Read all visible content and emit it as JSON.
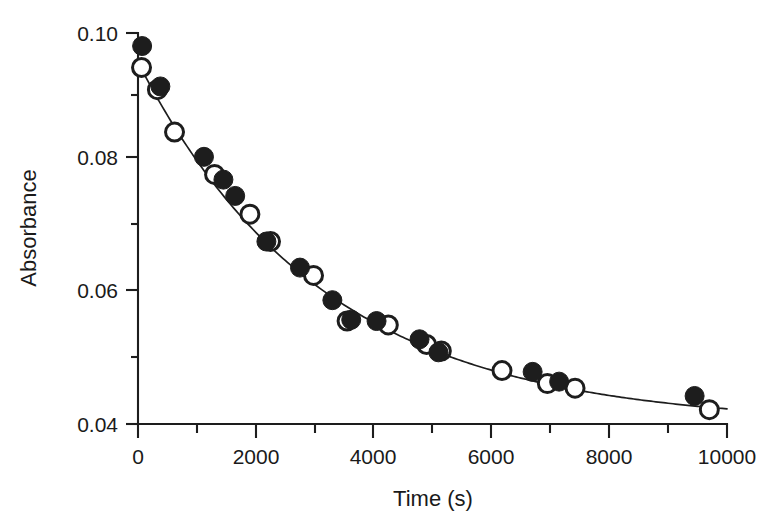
{
  "chart_data": {
    "type": "scatter",
    "title": "",
    "subtitle": "",
    "xlabel": "Time (s)",
    "ylabel": "Absorbance",
    "xlim": [
      0,
      10000
    ],
    "ylim": [
      0.04,
      0.1
    ],
    "xticks": [
      0,
      2000,
      4000,
      6000,
      8000,
      10000
    ],
    "xticklabels": [
      "0",
      "2000",
      "4000",
      "6000",
      "8000",
      "10000"
    ],
    "xminorticks": [
      1000,
      3000,
      5000,
      7000,
      9000
    ],
    "yticks": [
      0.04,
      0.06,
      0.08,
      0.1
    ],
    "yticklabels": [
      "0.04",
      "0.06",
      "0.08",
      "0.10"
    ],
    "yminorticks": [
      0.05,
      0.07,
      0.09
    ],
    "grid": false,
    "legend": null,
    "legend_position": "none",
    "annotations": [],
    "series": [
      {
        "name": "filled-circles",
        "marker": "filled-circle",
        "color": "#1d1d1d",
        "x": [
          70,
          380,
          1120,
          1450,
          1650,
          2180,
          2750,
          3300,
          3620,
          4050,
          4780,
          5100,
          6700,
          7150,
          9450
        ],
        "y": [
          0.098,
          0.0918,
          0.081,
          0.0775,
          0.075,
          0.068,
          0.064,
          0.059,
          0.056,
          0.0558,
          0.053,
          0.051,
          0.048,
          0.0465,
          0.0443
        ]
      },
      {
        "name": "open-circles",
        "marker": "open-circle",
        "color": "#1d1d1d",
        "x": [
          60,
          330,
          620,
          1300,
          1900,
          2250,
          2980,
          3550,
          4250,
          4900,
          5150,
          6180,
          6950,
          7420,
          9700
        ],
        "y": [
          0.0947,
          0.0913,
          0.0848,
          0.0783,
          0.0722,
          0.068,
          0.0628,
          0.0558,
          0.0552,
          0.0522,
          0.0512,
          0.0482,
          0.0462,
          0.0455,
          0.0422
        ]
      }
    ],
    "fit_curve": {
      "name": "exponential-fit",
      "model": "A(t) = A_inf + (A_0 - A_inf) * exp(-t / tau)",
      "A0": 0.0955,
      "Ainf": 0.04,
      "tau": 3150
    }
  },
  "axes": {
    "x_title": "Time (s)",
    "y_title": "Absorbance"
  }
}
